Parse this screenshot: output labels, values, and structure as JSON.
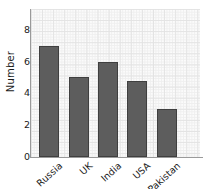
{
  "chart_data": {
    "type": "bar",
    "title": "",
    "xlabel": "",
    "ylabel": "Number",
    "categories": [
      "Russia",
      "UK",
      "India",
      "USA",
      "Pakistan"
    ],
    "values": [
      7,
      5,
      6,
      4.75,
      3
    ],
    "ylim": [
      0,
      9.3
    ],
    "yticks": [
      0,
      2,
      4,
      6,
      8
    ],
    "ytick_labels": [
      "0",
      "2",
      "4",
      "6",
      "8"
    ],
    "grid": true,
    "grid_style": "graph-paper minor and major gridlines",
    "legend": null,
    "legend_position": "none",
    "bar_color": "#5d5d5d",
    "bar_edge_color": "#3f3f3f",
    "plot_background": "#fbfbfb",
    "axis_color": "#9a9a9a",
    "text_color": "#1a1a1a",
    "xtick_label_rotation": -42
  },
  "axes": {
    "y_title": "Number"
  }
}
